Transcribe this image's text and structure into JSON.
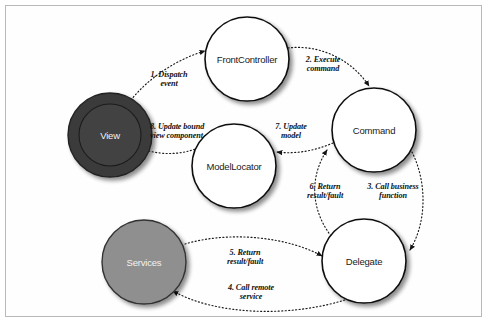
{
  "figure": {
    "border_color": "#b9b9b9",
    "background": "#ffffff"
  },
  "nodes": [
    {
      "id": "frontcontroller",
      "label": "FrontController",
      "cx": 247,
      "cy": 59,
      "r": 42,
      "fill": "#ffffff",
      "stroke": "#111111",
      "text_color": "dark"
    },
    {
      "id": "command",
      "label": "Command",
      "cx": 374,
      "cy": 130,
      "r": 42,
      "fill": "#ffffff",
      "stroke": "#111111",
      "text_color": "dark"
    },
    {
      "id": "modellocator",
      "label": "ModelLocator",
      "cx": 234,
      "cy": 166,
      "r": 42,
      "fill": "#ffffff",
      "stroke": "#111111",
      "text_color": "dark"
    },
    {
      "id": "view",
      "label": "View",
      "cx": 110,
      "cy": 135,
      "r": 42,
      "fill": "#3a3a3a",
      "stroke": "#222222",
      "text_color": "light",
      "inner_r": 31,
      "inner_fill": "#424242"
    },
    {
      "id": "delegate",
      "label": "Delegate",
      "cx": 364,
      "cy": 261,
      "r": 42,
      "fill": "#ffffff",
      "stroke": "#111111",
      "text_color": "dark"
    },
    {
      "id": "services",
      "label": "Services",
      "cx": 144,
      "cy": 262,
      "r": 42,
      "fill": "#8f8f8f",
      "stroke": "#333333",
      "text_color": "light"
    }
  ],
  "edges": [
    {
      "id": "e1",
      "label": "1. Dispatch\nevent",
      "from": "view",
      "to": "frontcontroller",
      "label_x": 169,
      "label_y": 79,
      "align": "c"
    },
    {
      "id": "e2",
      "label": "2. Execute\ncommand",
      "from": "frontcontroller",
      "to": "command",
      "label_x": 323,
      "label_y": 64,
      "align": "c"
    },
    {
      "id": "e3",
      "label": "3. Call business\nfunction",
      "from": "command",
      "to": "delegate",
      "label_x": 393,
      "label_y": 191,
      "align": "c"
    },
    {
      "id": "e4",
      "label": "4. Call remote\nservice",
      "from": "delegate",
      "to": "services",
      "label_x": 251,
      "label_y": 292,
      "align": "c"
    },
    {
      "id": "e5",
      "label": "5. Return\nresult/fault",
      "from": "services",
      "to": "delegate",
      "label_x": 245,
      "label_y": 257,
      "align": "c"
    },
    {
      "id": "e6",
      "label": "6. Return\nresult/fault",
      "from": "delegate",
      "to": "command",
      "label_x": 325,
      "label_y": 191,
      "align": "c"
    },
    {
      "id": "e7",
      "label": "7. Update\nmodel",
      "from": "command",
      "to": "modellocator",
      "label_x": 291,
      "label_y": 131,
      "align": "c"
    },
    {
      "id": "e8",
      "label": "8. Update bound\nview component",
      "from": "modellocator",
      "to": "view",
      "label_x": 150,
      "label_y": 131,
      "align": "l"
    }
  ]
}
